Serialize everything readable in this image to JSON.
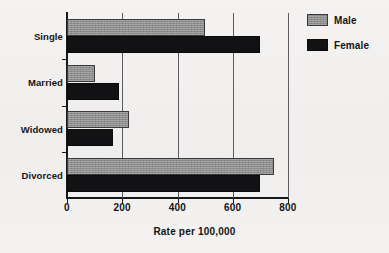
{
  "chart_data": {
    "type": "bar",
    "orientation": "horizontal",
    "title": "",
    "xlabel": "Rate per 100,000",
    "ylabel": "",
    "categories": [
      "Single",
      "Married",
      "Widowed",
      "Divorced"
    ],
    "series": [
      {
        "name": "Male",
        "color": "#8e8e8e",
        "values": [
          500,
          100,
          225,
          750
        ]
      },
      {
        "name": "Female",
        "color": "#121214",
        "values": [
          700,
          190,
          165,
          700
        ]
      }
    ],
    "xlim": [
      0,
      800
    ],
    "xticks": [
      0,
      200,
      400,
      600,
      800
    ],
    "xtick_labels": [
      "0",
      "200",
      "400",
      "600",
      "800"
    ],
    "grid": "vertical",
    "legend_position": "right-top"
  },
  "legend": {
    "items": [
      {
        "label": "Male",
        "swatch": "male-swatch"
      },
      {
        "label": "Female",
        "swatch": "female-swatch"
      }
    ]
  }
}
